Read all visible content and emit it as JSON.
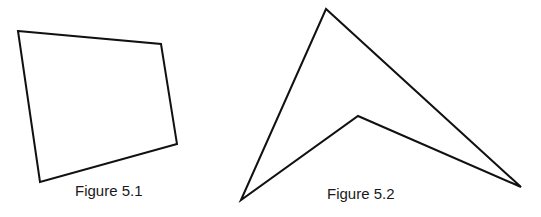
{
  "figures": [
    {
      "id": "figure-5-1",
      "caption": "Figure 5.1",
      "shape": "quadrilateral",
      "points": "18,31 161,44 177,144 40,182",
      "caption_pos": {
        "x": 75,
        "y": 182
      }
    },
    {
      "id": "figure-5-2",
      "caption": "Figure 5.2",
      "shape": "concave-quadrilateral (dart)",
      "points": "241,200 326,9 521,187 358,116",
      "caption_pos": {
        "x": 327,
        "y": 185
      }
    }
  ],
  "stroke_color": "#111111"
}
